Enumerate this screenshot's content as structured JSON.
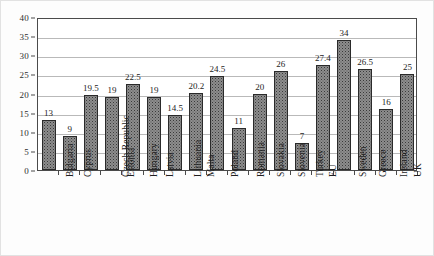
{
  "chart_data": {
    "type": "bar",
    "title": "",
    "subtitle": "",
    "xlabel": "",
    "ylabel": "",
    "ylim": [
      0,
      40
    ],
    "ytick_step": 5,
    "yticks": [
      "0",
      "5",
      "10",
      "15",
      "20",
      "25",
      "30",
      "35",
      "40"
    ],
    "grid": true,
    "legend": false,
    "legend_position": "none",
    "categories": [
      "Bulgaria",
      "Cyprus",
      "Czech Republic",
      "Estonia",
      "Hungary",
      "Latvia",
      "Lithuania",
      "Malta",
      "Poland",
      "Romania",
      "Slovakia",
      "Slovenia",
      "Turkey",
      "EU",
      "Sweden",
      "Greece",
      "Ireland",
      "UK"
    ],
    "values": [
      13,
      9,
      19.5,
      19,
      22.5,
      19,
      14.5,
      20.2,
      24.5,
      11,
      20,
      26,
      7,
      27.4,
      34,
      26.5,
      16,
      25
    ],
    "value_labels": [
      "13",
      "9",
      "19.5",
      "19",
      "22.5",
      "19",
      "14.5",
      "20.2",
      "24.5",
      "11",
      "20",
      "26",
      "7",
      "27.4",
      "34",
      "26.5",
      "16",
      "25"
    ],
    "bar_fill": "#8d8d8d",
    "bar_border": "#2a2a2a",
    "axis_color": "#4a4a4a",
    "grid_color": "#b9b9b9",
    "plot_background": "#ffffff"
  }
}
